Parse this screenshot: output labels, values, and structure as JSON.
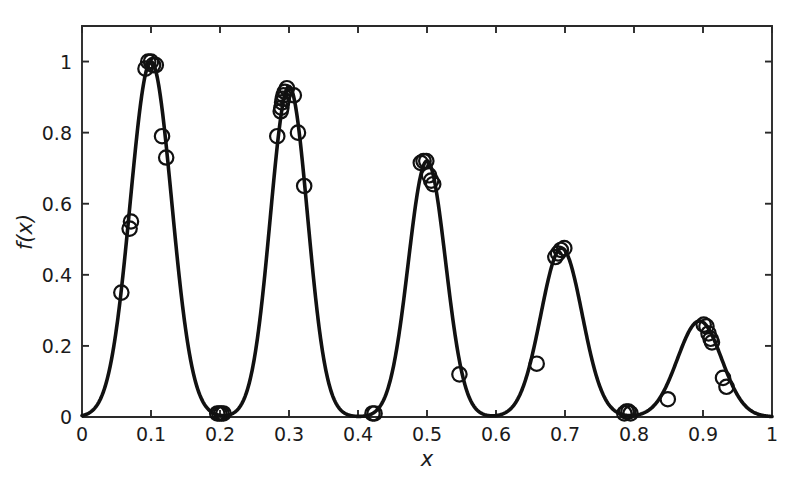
{
  "figure": {
    "background_color": "#ffffff",
    "ink_color": "#111111",
    "curve_label": "f(x) curve",
    "marker_label": "sample point"
  },
  "chart_data": {
    "type": "line",
    "title": "",
    "subtitle": "",
    "xlabel": "x",
    "ylabel": "f(x)",
    "xlim": [
      0,
      1
    ],
    "ylim": [
      0,
      1.1
    ],
    "grid": false,
    "legend": null,
    "x_ticks": [
      0,
      0.1,
      0.2,
      0.3,
      0.4,
      0.5,
      0.6,
      0.7,
      0.8,
      0.9,
      1
    ],
    "x_tick_labels": [
      "0",
      "0.1",
      "0.2",
      "0.3",
      "0.4",
      "0.5",
      "0.6",
      "0.7",
      "0.8",
      "0.9",
      "1"
    ],
    "y_ticks": [
      0,
      0.2,
      0.4,
      0.6,
      0.8,
      1
    ],
    "y_tick_labels": [
      "0",
      "0.2",
      "0.4",
      "0.6",
      "0.8",
      "1"
    ],
    "series": [
      {
        "name": "f(x)",
        "kind": "curve",
        "description": "Sum of five gaussian-like peaks of decreasing amplitude",
        "peaks": [
          {
            "center": 0.1,
            "amplitude": 1.0,
            "width": 0.03
          },
          {
            "center": 0.3,
            "amplitude": 0.93,
            "width": 0.027
          },
          {
            "center": 0.5,
            "amplitude": 0.72,
            "width": 0.027
          },
          {
            "center": 0.695,
            "amplitude": 0.475,
            "width": 0.03
          },
          {
            "center": 0.895,
            "amplitude": 0.27,
            "width": 0.032
          }
        ]
      },
      {
        "name": "sampled points",
        "kind": "scatter",
        "marker": "open-circle",
        "points": [
          {
            "x": 0.057,
            "y": 0.35
          },
          {
            "x": 0.069,
            "y": 0.53
          },
          {
            "x": 0.071,
            "y": 0.55
          },
          {
            "x": 0.092,
            "y": 0.98
          },
          {
            "x": 0.096,
            "y": 1.0
          },
          {
            "x": 0.1,
            "y": 1.0
          },
          {
            "x": 0.103,
            "y": 0.99
          },
          {
            "x": 0.107,
            "y": 0.99
          },
          {
            "x": 0.116,
            "y": 0.79
          },
          {
            "x": 0.122,
            "y": 0.73
          },
          {
            "x": 0.196,
            "y": 0.01
          },
          {
            "x": 0.199,
            "y": 0.01
          },
          {
            "x": 0.202,
            "y": 0.01
          },
          {
            "x": 0.205,
            "y": 0.01
          },
          {
            "x": 0.283,
            "y": 0.79
          },
          {
            "x": 0.288,
            "y": 0.86
          },
          {
            "x": 0.289,
            "y": 0.87
          },
          {
            "x": 0.29,
            "y": 0.885
          },
          {
            "x": 0.291,
            "y": 0.895
          },
          {
            "x": 0.292,
            "y": 0.905
          },
          {
            "x": 0.294,
            "y": 0.915
          },
          {
            "x": 0.297,
            "y": 0.925
          },
          {
            "x": 0.307,
            "y": 0.905
          },
          {
            "x": 0.313,
            "y": 0.8
          },
          {
            "x": 0.322,
            "y": 0.65
          },
          {
            "x": 0.421,
            "y": 0.01
          },
          {
            "x": 0.424,
            "y": 0.01
          },
          {
            "x": 0.491,
            "y": 0.715
          },
          {
            "x": 0.495,
            "y": 0.72
          },
          {
            "x": 0.499,
            "y": 0.72
          },
          {
            "x": 0.503,
            "y": 0.68
          },
          {
            "x": 0.506,
            "y": 0.665
          },
          {
            "x": 0.509,
            "y": 0.655
          },
          {
            "x": 0.547,
            "y": 0.12
          },
          {
            "x": 0.659,
            "y": 0.15
          },
          {
            "x": 0.686,
            "y": 0.45
          },
          {
            "x": 0.69,
            "y": 0.46
          },
          {
            "x": 0.694,
            "y": 0.47
          },
          {
            "x": 0.699,
            "y": 0.475
          },
          {
            "x": 0.786,
            "y": 0.01
          },
          {
            "x": 0.789,
            "y": 0.015
          },
          {
            "x": 0.792,
            "y": 0.015
          },
          {
            "x": 0.795,
            "y": 0.01
          },
          {
            "x": 0.849,
            "y": 0.05
          },
          {
            "x": 0.901,
            "y": 0.26
          },
          {
            "x": 0.905,
            "y": 0.255
          },
          {
            "x": 0.908,
            "y": 0.235
          },
          {
            "x": 0.911,
            "y": 0.22
          },
          {
            "x": 0.913,
            "y": 0.21
          },
          {
            "x": 0.929,
            "y": 0.11
          },
          {
            "x": 0.934,
            "y": 0.085
          }
        ]
      }
    ]
  }
}
